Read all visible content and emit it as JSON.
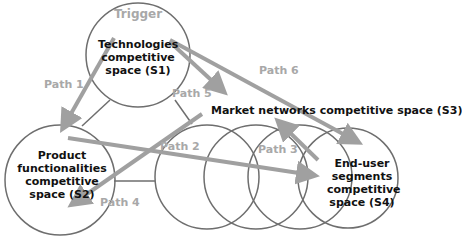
{
  "diagram": {
    "colors": {
      "circle_stroke": "#6e6e6e",
      "arrow": "#a0a0a0",
      "label_text": "#111111",
      "path_text": "#a8a8a8"
    },
    "nodes": {
      "s1": {
        "lines": [
          "Technologies",
          "competitive",
          "space (S1)"
        ]
      },
      "s2": {
        "lines": [
          "Product",
          "functionalities",
          "competitive",
          "space (S2)"
        ]
      },
      "s3": {
        "label": "Market networks competitive space (S3)"
      },
      "s4": {
        "lines": [
          "End-user",
          "segments",
          "competitive",
          "space (S4)"
        ]
      }
    },
    "trigger": "Trigger",
    "paths": {
      "p1": "Path 1",
      "p2": "Path 2",
      "p3": "Path 3",
      "p4": "Path 4",
      "p5": "Path 5",
      "p6": "Path 6"
    }
  }
}
